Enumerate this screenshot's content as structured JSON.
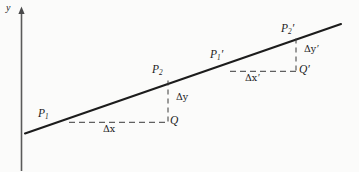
{
  "figure": {
    "kind": "geometry-diagram",
    "background_color": "#fbfbfa",
    "ink_color": "#1c1c1c",
    "axis": {
      "y_label": "y",
      "orientation": "vertical",
      "arrow": "up"
    },
    "line": {
      "stroke_width": 2.0,
      "from": [
        25,
        133
      ],
      "to": [
        341,
        24
      ]
    },
    "labels": {
      "p1": "P",
      "p1_sub": "1",
      "p2": "P",
      "p2_sub": "2",
      "q": "Q",
      "delta_x": "Δx",
      "delta_y": "Δy",
      "p1_prime": "P",
      "p1_prime_sub": "1",
      "p2_prime": "P",
      "p2_prime_sub": "2",
      "q_prime": "Q",
      "delta_x_prime": "Δx",
      "delta_y_prime": "Δy",
      "prime_mark": "′"
    },
    "triangle_small": {
      "horizontal_leg_label": "Δx",
      "vertical_leg_label": "Δy",
      "vertex_labels": [
        "P₁",
        "P₂",
        "Q"
      ],
      "corner_point": [
        168,
        122
      ],
      "horizontal_from": [
        70,
        122
      ],
      "vertical_from": [
        168,
        80
      ]
    },
    "triangle_large": {
      "horizontal_leg_label": "Δx′",
      "vertical_leg_label": "Δy′",
      "vertex_labels": [
        "P₁′",
        "P₂′",
        "Q′"
      ],
      "corner_point": [
        296,
        71
      ],
      "horizontal_from": [
        231,
        71
      ],
      "vertical_from": [
        296,
        38
      ]
    },
    "dash": {
      "pattern": "6 4",
      "stroke_width": 1.0
    }
  }
}
